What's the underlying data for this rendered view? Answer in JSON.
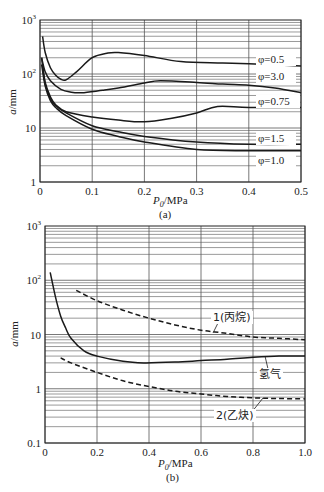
{
  "chart_data": [
    {
      "type": "line",
      "panel": "(a)",
      "title": "",
      "caption": "(a)",
      "xlabel": "P0/MPa",
      "ylabel": "a/mm",
      "xscale": "linear",
      "yscale": "log",
      "xlim": [
        0,
        0.5
      ],
      "ylim": [
        1,
        1000
      ],
      "xticks": [
        "0",
        "0.1",
        "0.2",
        "0.3",
        "0.4",
        "0.5"
      ],
      "yticks": [
        "1",
        "10",
        "10²",
        "10³"
      ],
      "grid": true,
      "series": [
        {
          "name": "φ=0.5",
          "style": "solid",
          "x": [
            0.005,
            0.01,
            0.02,
            0.03,
            0.04,
            0.05,
            0.07,
            0.1,
            0.13,
            0.15,
            0.2,
            0.27,
            0.35,
            0.4,
            0.5
          ],
          "y": [
            500,
            250,
            130,
            95,
            80,
            78,
            110,
            200,
            245,
            250,
            220,
            170,
            160,
            155,
            140
          ]
        },
        {
          "name": "φ=3.0",
          "style": "solid",
          "x": [
            0.003,
            0.01,
            0.02,
            0.04,
            0.06,
            0.08,
            0.12,
            0.15,
            0.2,
            0.23,
            0.3,
            0.35,
            0.4,
            0.45,
            0.5
          ],
          "y": [
            200,
            110,
            75,
            52,
            46,
            45,
            50,
            55,
            68,
            75,
            70,
            65,
            62,
            55,
            45
          ]
        },
        {
          "name": "φ=0.75",
          "style": "solid",
          "x": [
            0.005,
            0.01,
            0.02,
            0.03,
            0.05,
            0.1,
            0.15,
            0.2,
            0.25,
            0.3,
            0.34,
            0.4,
            0.5
          ],
          "y": [
            150,
            70,
            38,
            27,
            20,
            16,
            14,
            13,
            15,
            19,
            25,
            24,
            24
          ]
        },
        {
          "name": "φ=1.5",
          "style": "solid",
          "x": [
            0.003,
            0.01,
            0.02,
            0.03,
            0.05,
            0.1,
            0.15,
            0.2,
            0.3,
            0.4,
            0.5
          ],
          "y": [
            200,
            65,
            35,
            26,
            19,
            11,
            8.5,
            7,
            5.5,
            5,
            5
          ]
        },
        {
          "name": "φ=1.0",
          "style": "solid",
          "x": [
            0.003,
            0.01,
            0.02,
            0.03,
            0.05,
            0.1,
            0.15,
            0.2,
            0.3,
            0.4,
            0.5
          ],
          "y": [
            150,
            60,
            32,
            24,
            17,
            9.5,
            7,
            5.5,
            4,
            3.8,
            3.8
          ]
        }
      ],
      "annotations": [
        "φ=0.5",
        "φ=3.0",
        "φ=0.75",
        "φ=1.5",
        "φ=1.0"
      ]
    },
    {
      "type": "line",
      "panel": "(b)",
      "title": "",
      "caption": "(b)",
      "xlabel": "P0/MPa",
      "ylabel": "a/mm",
      "xscale": "linear",
      "yscale": "log",
      "xlim": [
        0,
        1.0
      ],
      "ylim": [
        0.1,
        1000
      ],
      "xticks": [
        "0",
        "0.2",
        "0.4",
        "0.6",
        "0.8",
        "1.0"
      ],
      "yticks": [
        "0.1",
        "1",
        "10",
        "10²",
        "10³"
      ],
      "grid": true,
      "series": [
        {
          "name": "1(丙烷)",
          "style": "dashed",
          "x": [
            0.12,
            0.2,
            0.3,
            0.4,
            0.5,
            0.6,
            0.7,
            0.8,
            0.9,
            1.0
          ],
          "y": [
            65,
            42,
            28,
            20,
            15,
            12,
            10.5,
            9,
            8.5,
            8
          ]
        },
        {
          "name": "氢气",
          "style": "solid",
          "x": [
            0.02,
            0.04,
            0.06,
            0.08,
            0.1,
            0.15,
            0.2,
            0.3,
            0.38,
            0.5,
            0.6,
            0.7,
            0.8,
            0.9,
            1.0
          ],
          "y": [
            140,
            50,
            22,
            13,
            8.5,
            5,
            4,
            3.2,
            3.0,
            3.1,
            3.3,
            3.5,
            3.8,
            4,
            4
          ]
        },
        {
          "name": "2(乙炔)",
          "style": "dashed",
          "x": [
            0.06,
            0.1,
            0.2,
            0.3,
            0.4,
            0.5,
            0.6,
            0.7,
            0.8,
            0.9,
            1.0
          ],
          "y": [
            3.7,
            3.0,
            2.0,
            1.4,
            1.1,
            0.9,
            0.8,
            0.72,
            0.68,
            0.66,
            0.65
          ]
        }
      ],
      "annotations": [
        "1(丙烷)",
        "氢气",
        "2(乙炔)"
      ]
    }
  ],
  "panels": {
    "a": {
      "caption": "(a)",
      "xlabel_main": "P",
      "xlabel_sub": "0",
      "xlabel_unit": "/MPa",
      "ylabel_var": "a",
      "ylabel_unit": "/mm",
      "legend": [
        "φ=0.5",
        "φ=3.0",
        "φ=0.75",
        "φ=1.5",
        "φ=1.0"
      ]
    },
    "b": {
      "caption": "(b)",
      "xlabel_main": "P",
      "xlabel_sub": "0",
      "xlabel_unit": "/MPa",
      "ylabel_var": "a",
      "ylabel_unit": "/mm",
      "legend": [
        "1(丙烷)",
        "氢气",
        "2(乙炔)"
      ]
    }
  },
  "colors": {
    "line": "#1a1a1a",
    "grid": "#555555",
    "background": "#ffffff"
  }
}
